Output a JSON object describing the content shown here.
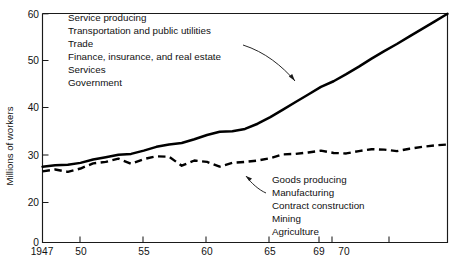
{
  "chart_data": {
    "type": "line",
    "title": "",
    "xlabel": "",
    "ylabel": "Millions of workers",
    "xlim": [
      1947,
      1979
    ],
    "ylim": [
      0,
      60
    ],
    "grid": false,
    "legend_position": "inline-annotation",
    "y_axis_note": "axis compressed between 0 and 20",
    "x_tick_labels": [
      "1947",
      "50",
      "55",
      "60",
      "65",
      "69",
      "70"
    ],
    "x_tick_values": [
      1947,
      1950,
      1955,
      1960,
      1965,
      1969,
      1970
    ],
    "x_unlabeled_tick_values": [
      1974.5
    ],
    "y_tick_labels": [
      "0",
      "20",
      "30",
      "40",
      "50",
      "60"
    ],
    "y_tick_values": [
      0,
      20,
      30,
      40,
      50,
      60
    ],
    "series": [
      {
        "name": "Service producing",
        "style": "solid",
        "color": "#000000",
        "x": [
          1947,
          1948,
          1949,
          1950,
          1951,
          1952,
          1953,
          1954,
          1955,
          1956,
          1957,
          1958,
          1959,
          1960,
          1961,
          1962,
          1963,
          1964,
          1965,
          1966,
          1967,
          1968,
          1969,
          1970,
          1971,
          1972,
          1973,
          1974,
          1975,
          1976,
          1977,
          1978,
          1979
        ],
        "values": [
          27.6,
          27.9,
          28.0,
          28.4,
          29.1,
          29.6,
          30.1,
          30.3,
          31.0,
          31.8,
          32.3,
          32.6,
          33.4,
          34.3,
          35.0,
          35.1,
          35.6,
          36.7,
          38.1,
          39.7,
          41.3,
          42.9,
          44.5,
          45.7,
          47.2,
          48.8,
          50.5,
          52.1,
          53.6,
          55.2,
          56.8,
          58.4,
          60.0
        ]
      },
      {
        "name": "Goods producing",
        "style": "dashed",
        "color": "#000000",
        "x": [
          1947,
          1948,
          1949,
          1950,
          1951,
          1952,
          1953,
          1954,
          1955,
          1956,
          1957,
          1958,
          1959,
          1960,
          1961,
          1962,
          1963,
          1964,
          1965,
          1966,
          1967,
          1968,
          1969,
          1970,
          1971,
          1972,
          1973,
          1974,
          1975,
          1976,
          1977,
          1978,
          1979
        ],
        "values": [
          26.6,
          27.0,
          26.5,
          27.2,
          28.3,
          28.6,
          29.3,
          28.2,
          29.2,
          29.8,
          29.7,
          27.8,
          28.9,
          28.6,
          27.6,
          28.4,
          28.6,
          28.9,
          29.4,
          30.2,
          30.3,
          30.6,
          31.0,
          30.5,
          30.4,
          30.9,
          31.3,
          31.2,
          30.9,
          31.4,
          31.8,
          32.1,
          32.3
        ]
      }
    ],
    "annotations": [
      {
        "id": "service-producing-group",
        "target_series": "Service producing",
        "lines": [
          "Service producing",
          "Transportation and public utilities",
          "Trade",
          "Finance, insurance, and real estate",
          "Services",
          "Government"
        ]
      },
      {
        "id": "goods-producing-group",
        "target_series": "Goods producing",
        "lines": [
          "Goods producing",
          "Manufacturing",
          "Contract construction",
          "Mining",
          "Agriculture"
        ]
      }
    ]
  }
}
